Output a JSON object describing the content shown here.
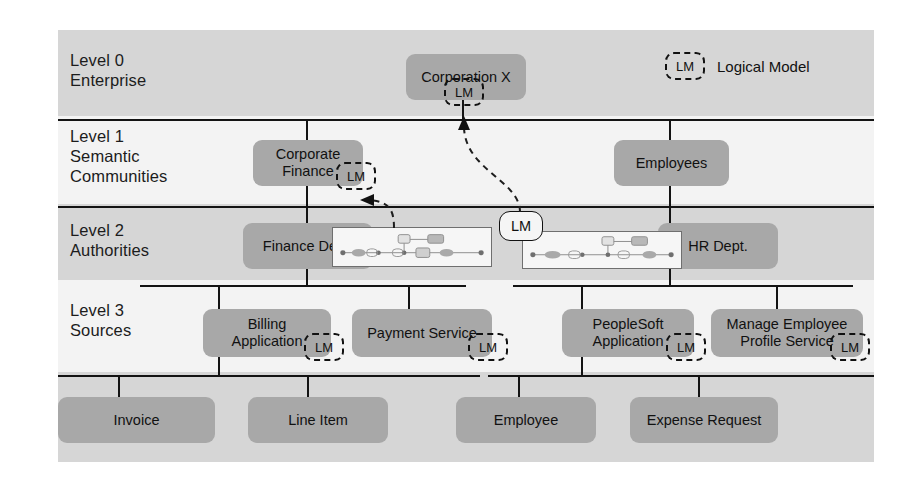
{
  "figure": {
    "accent_box_color": "#a8a8a8",
    "band_dark_color": "#d6d6d6",
    "band_light_color": "#f3f3f3",
    "line_color": "#131313"
  },
  "legend": {
    "badge": "LM",
    "label": "Logical Model"
  },
  "levels": [
    {
      "id": "level-0",
      "label": "Level 0\nEnterprise"
    },
    {
      "id": "level-1",
      "label": "Level 1\nSemantic\nCommunities"
    },
    {
      "id": "level-2",
      "label": "Level 2\nAuthorities"
    },
    {
      "id": "level-3",
      "label": "Level 3\nSources"
    },
    {
      "id": "level-4",
      "label": "Level 4\nEntities"
    }
  ],
  "nodes": {
    "corporation_x": "Corporation X",
    "corporate_finance": "Corporate\nFinance",
    "employees": "Employees",
    "finance_dept": "Finance Dept.",
    "hr_dept": "HR Dept.",
    "billing_application": "Billing\nApplication",
    "payment_service": "Payment Service",
    "peoplesoft_application": "PeopleSoft\nApplication",
    "manage_employee_profile_service": "Manage Employee\nProfile Service",
    "invoice": "Invoice",
    "line_item": "Line Item",
    "employee": "Employee",
    "expense_request": "Expense Request"
  },
  "badges": {
    "corporation_x_lm": "LM",
    "corporate_finance_lm": "LM",
    "level2_lm": "LM",
    "billing_application_lm": "LM",
    "payment_service_lm": "LM",
    "peoplesoft_application_lm": "LM",
    "manage_employee_profile_service_lm": "LM"
  }
}
